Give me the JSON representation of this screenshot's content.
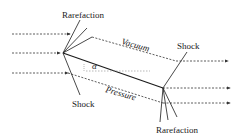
{
  "diagram": {
    "labels": {
      "rarefaction_top": "Rarefaction",
      "vacuum": "Vacuum",
      "shock_right": "Shock",
      "alpha": "α",
      "shock_bottom": "Shock",
      "pressure": "Pressure",
      "rarefaction_bottom": "Rarefaction"
    },
    "colors": {
      "line": "#1a1a1a",
      "dashed": "#333333",
      "background": "#ffffff"
    }
  }
}
